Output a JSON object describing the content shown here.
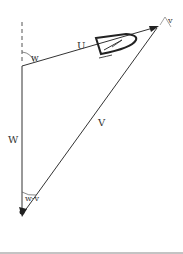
{
  "diagram": {
    "type": "vector-triangle",
    "labels": {
      "U": "U",
      "V": "V",
      "W": "W",
      "w": "w",
      "v": "v",
      "w_minus_v": "w-v"
    },
    "vectors": [
      {
        "name": "U",
        "from": [
          22,
          66
        ],
        "to": [
          157,
          27
        ]
      },
      {
        "name": "V",
        "from": [
          157,
          27
        ],
        "to": [
          22,
          215
        ]
      },
      {
        "name": "W",
        "from": [
          22,
          66
        ],
        "to": [
          22,
          215
        ]
      }
    ],
    "colors": {
      "line": "#333333",
      "boat": "#222222"
    }
  }
}
